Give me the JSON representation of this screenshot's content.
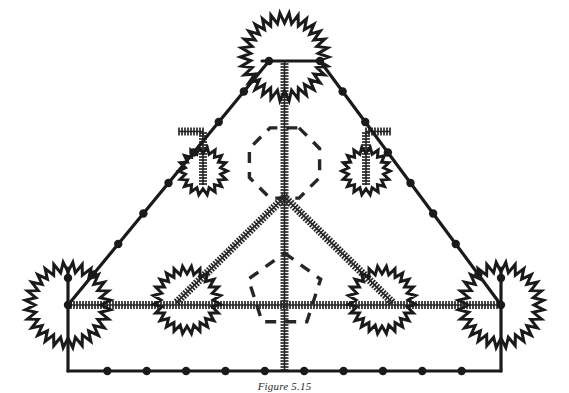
{
  "figure": {
    "caption": "Figure 5.15",
    "width": 569,
    "height": 393,
    "background_color": "#ffffff",
    "ink_color": "#1a1a1a"
  },
  "style": {
    "solid_line_color": "#1a1a1a",
    "solid_line_width": 3.2,
    "ladder_line_color": "#262626",
    "ladder_line_width": 3.0,
    "wavy_line_color": "#1a1a1a",
    "wavy_line_width": 3.0,
    "dashed_line_color": "#262626",
    "dashed_line_width": 3.4,
    "dashed_pattern": "11 9",
    "vertex_dot_color": "#1a1a1a",
    "vertex_dot_radius": 4.2
  },
  "legend": {
    "line_kinds": [
      {
        "id": "solid",
        "label": "solid propagator"
      },
      {
        "id": "ladder",
        "label": "ladder / hatched propagator"
      },
      {
        "id": "wavy",
        "label": "wavy loop"
      },
      {
        "id": "dashed",
        "label": "dashed internal loop"
      }
    ]
  },
  "geometry": {
    "apex": {
      "x": 284.5,
      "y": 58.0,
      "label": "apex-vertex"
    },
    "left_corner": {
      "x": 68.0,
      "y": 305.0,
      "label": "left-corner-vertex"
    },
    "right_corner": {
      "x": 501.0,
      "y": 305.0,
      "label": "right-corner-vertex"
    },
    "bottom_left": {
      "x": 68.0,
      "y": 371.0,
      "label": "bottom-left-corner"
    },
    "bottom_right": {
      "x": 501.0,
      "y": 371.0,
      "label": "bottom-right-corner"
    },
    "center_vertex": {
      "x": 284.5,
      "y": 197.0,
      "label": "center-branch-vertex"
    },
    "apex_left_node": {
      "x": 269.0,
      "y": 61.0
    },
    "apex_right_node": {
      "x": 320.0,
      "y": 61.0
    }
  },
  "elements": {
    "outer_triangle": {
      "name": "outer-triangle",
      "left_edge": {
        "from": "apex_left_node",
        "to": "left_corner",
        "kind": "solid",
        "dot_count": 7
      },
      "right_edge": {
        "from": "apex_right_node",
        "to": "right_corner",
        "kind": "solid",
        "dot_count": 7
      },
      "bottom_edge": {
        "from": "bottom_left",
        "to": "bottom_right",
        "kind": "solid",
        "dot_count": 10
      }
    },
    "apex_loop": {
      "name": "apex-wavy-loop",
      "kind": "wavy",
      "cx": 284.5,
      "cy": 57.0,
      "r": 39.0,
      "teeth": 30
    },
    "apex_bar": {
      "name": "apex-horizontal-bar",
      "kind": "solid",
      "x1": 262.0,
      "y1": 61.0,
      "x2": 322.0,
      "y2": 61.0
    },
    "center_spine": {
      "name": "center-ladder-spine",
      "kind": "ladder",
      "x1": 284.5,
      "y1": 61.0,
      "x2": 284.5,
      "y2": 371.0
    },
    "v_branches": {
      "name": "center-v-branches",
      "kind": "ladder",
      "left": {
        "x1": 284.5,
        "y1": 197.0,
        "x2": 176.0,
        "y2": 303.0
      },
      "right": {
        "x1": 284.5,
        "y1": 197.0,
        "x2": 393.0,
        "y2": 303.0
      }
    },
    "dashed_octagon": {
      "name": "dashed-octagon-loop",
      "kind": "dashed",
      "cx": 284.5,
      "cy": 163.0,
      "r": 38.0,
      "sides": 8
    },
    "dashed_pentagon": {
      "name": "dashed-pentagon-loop",
      "kind": "dashed",
      "cx": 284.5,
      "cy": 291.0,
      "r": 38.0,
      "sides": 5
    },
    "horizontal_ladder": {
      "name": "horizontal-ladder-rail",
      "kind": "ladder",
      "x1": 68.0,
      "y1": 305.0,
      "x2": 501.0,
      "y2": 305.0
    },
    "small_loops": [
      {
        "name": "upper-left-small-loop",
        "kind": "wavy",
        "cx": 203.0,
        "cy": 171.0,
        "r": 21.0,
        "teeth": 18,
        "stem": {
          "x1": 203.0,
          "y1": 133.0,
          "x2": 203.0,
          "y2": 185.0,
          "kind": "ladder"
        },
        "elbow": {
          "x1": 179.0,
          "y1": 131.5,
          "x2": 203.0,
          "y2": 131.5,
          "kind": "ladder"
        },
        "anchor_on_edge": {
          "x": 178.0,
          "y": 131.0
        }
      },
      {
        "name": "upper-right-small-loop",
        "kind": "wavy",
        "cx": 366.0,
        "cy": 171.0,
        "r": 21.0,
        "teeth": 18,
        "stem": {
          "x1": 366.0,
          "y1": 133.0,
          "x2": 366.0,
          "y2": 185.0,
          "kind": "ladder"
        },
        "elbow": {
          "x1": 366.0,
          "y1": 131.5,
          "x2": 390.0,
          "y2": 131.5,
          "kind": "ladder"
        },
        "anchor_on_edge": {
          "x": 391.0,
          "y": 131.0
        }
      }
    ],
    "corner_loops": [
      {
        "name": "left-corner-wavy-loop",
        "kind": "wavy",
        "cx": 68.0,
        "cy": 305.0,
        "r": 38.0,
        "teeth": 28
      },
      {
        "name": "right-corner-wavy-loop",
        "kind": "wavy",
        "cx": 501.0,
        "cy": 305.0,
        "r": 38.0,
        "teeth": 28
      },
      {
        "name": "inner-left-wavy-loop",
        "kind": "wavy",
        "cx": 187.0,
        "cy": 300.0,
        "r": 30.0,
        "teeth": 24
      },
      {
        "name": "inner-right-wavy-loop",
        "kind": "wavy",
        "cx": 382.0,
        "cy": 300.0,
        "r": 30.0,
        "teeth": 24
      }
    ],
    "corner_verticals": [
      {
        "name": "left-corner-vertical",
        "kind": "solid",
        "x1": 68.0,
        "y1": 268.0,
        "x2": 68.0,
        "y2": 371.0
      },
      {
        "name": "right-corner-vertical",
        "kind": "solid",
        "x1": 501.0,
        "y1": 268.0,
        "x2": 501.0,
        "y2": 371.0
      }
    ],
    "vertex_dots": [
      {
        "name": "apex-left-dot",
        "x": 269.0,
        "y": 61.0
      },
      {
        "name": "apex-right-dot",
        "x": 320.0,
        "y": 61.0
      },
      {
        "name": "left-corner-upper-dot",
        "x": 68.0,
        "y": 278.0
      },
      {
        "name": "left-corner-mid-dot",
        "x": 68.0,
        "y": 305.0
      },
      {
        "name": "right-corner-upper-dot",
        "x": 501.0,
        "y": 278.0
      },
      {
        "name": "right-corner-mid-dot",
        "x": 501.0,
        "y": 305.0
      }
    ]
  }
}
